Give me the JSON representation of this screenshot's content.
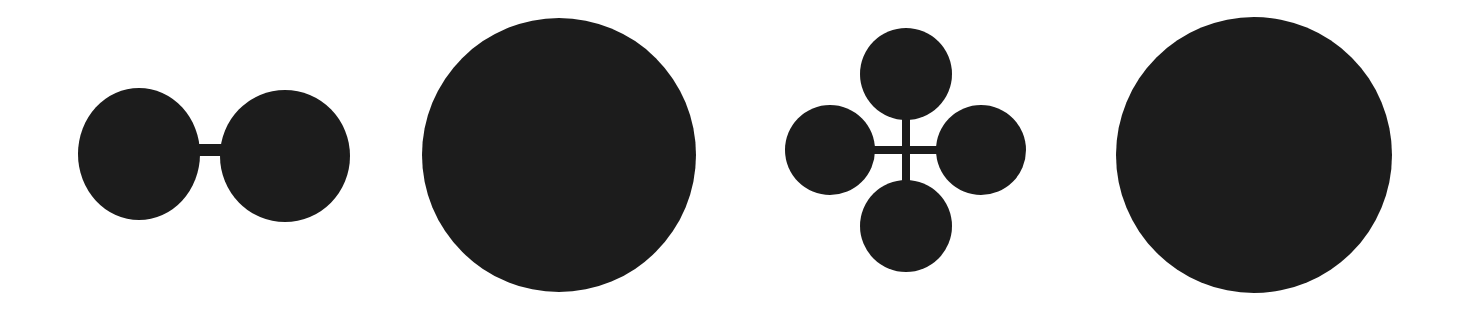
{
  "figure": {
    "fill_color": "#1c1c1c",
    "background_color": "#ffffff",
    "shapes": [
      {
        "name": "two-lobe-shape",
        "type": "two circles joined by a bridge",
        "circles": [
          {
            "cx": 139,
            "cy": 154,
            "rx": 61,
            "ry": 66
          },
          {
            "cx": 285,
            "cy": 156,
            "rx": 65,
            "ry": 66
          }
        ],
        "bridge": {
          "x": 196,
          "y": 144,
          "width": 28,
          "height": 12
        }
      },
      {
        "name": "large-circle-1",
        "type": "circle",
        "cx": 559,
        "cy": 155,
        "r": 137
      },
      {
        "name": "four-lobe-shape",
        "type": "four circles joined by a cross",
        "circles": [
          {
            "cx": 906,
            "cy": 74,
            "r": 46
          },
          {
            "cx": 830,
            "cy": 150,
            "r": 45
          },
          {
            "cx": 981,
            "cy": 150,
            "r": 45
          },
          {
            "cx": 906,
            "cy": 226,
            "r": 46
          }
        ],
        "cross": {
          "cx": 906,
          "cy": 150,
          "arm": 8
        }
      },
      {
        "name": "large-circle-2",
        "type": "circle",
        "cx": 1254,
        "cy": 155,
        "r": 138
      }
    ]
  }
}
